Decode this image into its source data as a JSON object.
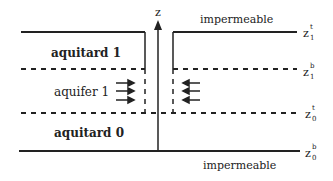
{
  "diagram": {
    "axis_label": "z",
    "layers": [
      {
        "name": "aquitard 1"
      },
      {
        "name": "aquifer 1"
      },
      {
        "name": "aquitard 0"
      }
    ],
    "boundaries": {
      "top": "impermeable",
      "bottom": "impermeable"
    },
    "elevations": [
      {
        "base": "z",
        "sup": "t",
        "sub": "1"
      },
      {
        "base": "z",
        "sup": "b",
        "sub": "1"
      },
      {
        "base": "z",
        "sup": "t",
        "sub": "0"
      },
      {
        "base": "z",
        "sup": "b",
        "sub": "0"
      }
    ],
    "colors": {
      "line": "#222222",
      "background": "#ffffff"
    }
  }
}
